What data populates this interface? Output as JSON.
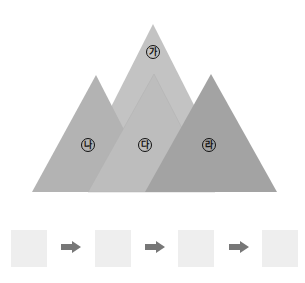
{
  "diagram": {
    "triangles": [
      {
        "id": "ga",
        "label": "가",
        "color": "#c3c3c3"
      },
      {
        "id": "na",
        "label": "나",
        "color": "#b3b3b3"
      },
      {
        "id": "da",
        "label": "다",
        "color": "#bdbdbd"
      },
      {
        "id": "ra",
        "label": "라",
        "color": "#a3a3a3"
      }
    ]
  },
  "sequence": {
    "boxes": [
      "",
      "",
      "",
      ""
    ],
    "arrow_color": "#777777",
    "box_color": "#eeeeee"
  }
}
